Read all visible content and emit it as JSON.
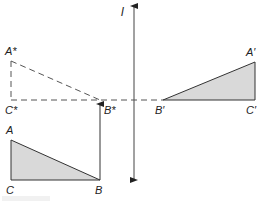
{
  "diagram": {
    "lens_label": "l",
    "labels": {
      "A_star": "A*",
      "C_star": "C*",
      "B_star": "B*",
      "A_prime": "A′",
      "B_prime": "B′",
      "C_prime": "C′",
      "A": "A",
      "B": "B",
      "C": "C"
    },
    "colors": {
      "line": "#333333",
      "fill": "#d9d9d9",
      "dashed": "#555555"
    },
    "points": {
      "A_star": [
        11,
        61
      ],
      "C_star": [
        11,
        100
      ],
      "B_star": [
        100,
        100
      ],
      "B_prime": [
        163,
        100
      ],
      "A_prime": [
        255,
        62
      ],
      "C_prime": [
        255,
        100
      ],
      "A": [
        11,
        140
      ],
      "C": [
        11,
        180
      ],
      "B": [
        100,
        180
      ]
    }
  }
}
